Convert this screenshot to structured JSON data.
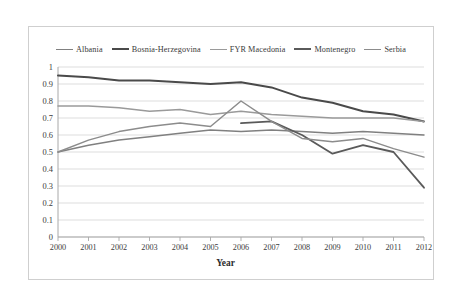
{
  "chart_data": {
    "type": "line",
    "title": "",
    "xlabel": "Year",
    "ylabel": "",
    "x": [
      2000,
      2001,
      2002,
      2003,
      2004,
      2005,
      2006,
      2007,
      2008,
      2009,
      2010,
      2011,
      2012
    ],
    "categories": [
      "2000",
      "2001",
      "2002",
      "2003",
      "2004",
      "2005",
      "2006",
      "2007",
      "2008",
      "2009",
      "2010",
      "2011",
      "2012"
    ],
    "ylim": [
      0,
      1
    ],
    "yticks": [
      "0",
      "0.1",
      "0.2",
      "0.3",
      "0.4",
      "0.5",
      "0.6",
      "0.7",
      "0.8",
      "0.9",
      "1"
    ],
    "grid": "horizontal",
    "legend_position": "top",
    "series": [
      {
        "name": "Albania",
        "color": "#808080",
        "width": 1.5,
        "values": [
          0.5,
          0.54,
          0.57,
          0.59,
          0.61,
          0.63,
          0.62,
          0.63,
          0.62,
          0.61,
          0.62,
          0.61,
          0.6
        ]
      },
      {
        "name": "Bosnia-Herzegovina",
        "color": "#4a4a4a",
        "width": 2.0,
        "values": [
          0.95,
          0.94,
          0.92,
          0.92,
          0.91,
          0.9,
          0.91,
          0.88,
          0.82,
          0.79,
          0.74,
          0.72,
          0.68
        ]
      },
      {
        "name": "FYR Macedonia",
        "color": "#9a9a9a",
        "width": 1.5,
        "values": [
          0.77,
          0.77,
          0.76,
          0.74,
          0.75,
          0.72,
          0.74,
          0.72,
          0.71,
          0.7,
          0.7,
          0.7,
          0.68
        ]
      },
      {
        "name": "Montenegro",
        "color": "#5a5a5a",
        "width": 1.8,
        "values": [
          null,
          null,
          null,
          null,
          null,
          null,
          0.67,
          0.68,
          0.6,
          0.49,
          0.54,
          0.5,
          0.29
        ]
      },
      {
        "name": "Serbia",
        "color": "#8c8c8c",
        "width": 1.5,
        "values": [
          0.5,
          0.57,
          0.62,
          0.65,
          0.67,
          0.65,
          0.8,
          0.68,
          0.58,
          0.56,
          0.58,
          0.52,
          0.47
        ]
      }
    ]
  },
  "legend": {
    "items": [
      {
        "label": "Albania"
      },
      {
        "label": "Bosnia-Herzegovina"
      },
      {
        "label": "FYR Macedonia"
      },
      {
        "label": "Montenegro"
      },
      {
        "label": "Serbia"
      }
    ]
  },
  "axes": {
    "x_title": "Year"
  }
}
